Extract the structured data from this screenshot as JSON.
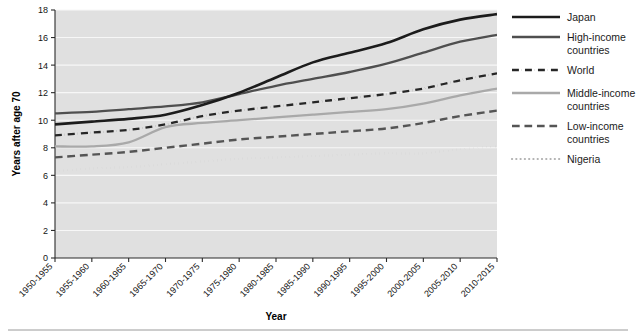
{
  "chart_data": {
    "type": "line",
    "title": "",
    "xlabel": "Year",
    "ylabel": "Years after age 70",
    "ylim": [
      0,
      18
    ],
    "ytick_step": 2,
    "yticks": [
      "0",
      "2",
      "4",
      "6",
      "8",
      "10",
      "12",
      "14",
      "16",
      "18"
    ],
    "grid": true,
    "grid_orientation": "horizontal",
    "legend_position": "right",
    "plot_background": "#e0e0e0",
    "categories": [
      "1950-1955",
      "1955-1960",
      "1960-1965",
      "1965-1970",
      "1970-1975",
      "1975-1980",
      "1980-1985",
      "1985-1990",
      "1990-1995",
      "1995-2000",
      "2000-2005",
      "2005-2010",
      "2010-2015"
    ],
    "series": [
      {
        "name": "Japan",
        "color": "#1c1c1c",
        "style": "solid",
        "width": 2.6,
        "values": [
          9.7,
          9.9,
          10.1,
          10.4,
          11.1,
          12.0,
          13.1,
          14.2,
          14.9,
          15.6,
          16.6,
          17.3,
          17.7
        ]
      },
      {
        "name": "High-income countries",
        "color": "#4f4f4f",
        "style": "solid",
        "width": 2.3,
        "values": [
          10.5,
          10.6,
          10.8,
          11.0,
          11.3,
          11.9,
          12.5,
          13.0,
          13.5,
          14.1,
          14.9,
          15.7,
          16.2
        ]
      },
      {
        "name": "World",
        "color": "#262626",
        "style": "dashdot",
        "width": 2.3,
        "values": [
          8.9,
          9.1,
          9.3,
          9.7,
          10.3,
          10.7,
          11.0,
          11.3,
          11.6,
          11.9,
          12.3,
          12.9,
          13.4
        ]
      },
      {
        "name": "Middle-income countries",
        "color": "#a9a9a9",
        "style": "solid",
        "width": 2.3,
        "values": [
          8.1,
          8.1,
          8.4,
          9.5,
          9.8,
          10.0,
          10.2,
          10.4,
          10.6,
          10.8,
          11.2,
          11.8,
          12.3
        ]
      },
      {
        "name": "Low-income countries",
        "color": "#555555",
        "style": "dashed",
        "width": 2.4,
        "values": [
          7.3,
          7.5,
          7.7,
          8.0,
          8.3,
          8.6,
          8.8,
          9.0,
          9.2,
          9.4,
          9.8,
          10.3,
          10.7
        ]
      },
      {
        "name": "Nigeria",
        "color": "#b0b0b0",
        "style": "dotted",
        "width": 2.2,
        "values": [
          6.3,
          6.5,
          6.6,
          6.8,
          7.0,
          7.2,
          7.3,
          7.4,
          7.5,
          7.6,
          7.6,
          7.9,
          8.1
        ]
      }
    ]
  },
  "legend": {
    "entries": [
      {
        "label": "Japan"
      },
      {
        "label": "High-income countries"
      },
      {
        "label": "World"
      },
      {
        "label": "Middle-income countries"
      },
      {
        "label": "Low-income countries"
      },
      {
        "label": "Nigeria"
      }
    ]
  }
}
